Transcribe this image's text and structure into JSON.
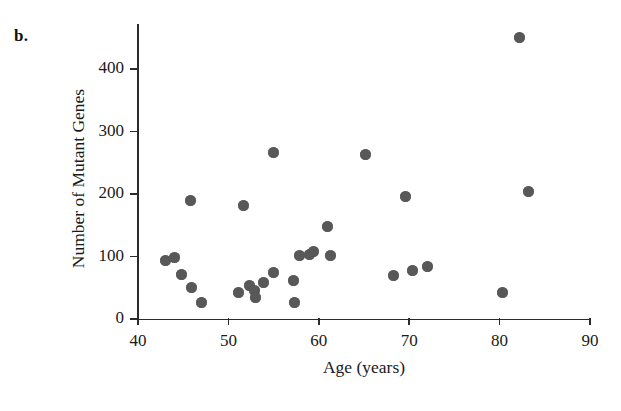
{
  "panel": {
    "label": "b."
  },
  "chart_data": {
    "type": "scatter",
    "title": "",
    "xlabel": "Age (years)",
    "ylabel": "Number of Mutant Genes",
    "xlim": [
      40,
      90
    ],
    "ylim": [
      0,
      450
    ],
    "xticks": [
      40,
      50,
      60,
      70,
      80,
      90
    ],
    "xtick_labels": [
      "40",
      "50",
      "60",
      "70",
      "80",
      "90"
    ],
    "yticks": [
      0,
      100,
      200,
      300,
      400
    ],
    "ytick_labels": [
      "0",
      "100",
      "200",
      "300",
      "400"
    ],
    "grid": false,
    "legend": null,
    "marker": {
      "shape": "circle",
      "color": "#585858",
      "size": 11
    },
    "series": [
      {
        "name": "Individuals",
        "points": [
          {
            "x": 43.0,
            "y": 93
          },
          {
            "x": 44.0,
            "y": 98
          },
          {
            "x": 44.8,
            "y": 72
          },
          {
            "x": 45.8,
            "y": 190
          },
          {
            "x": 45.9,
            "y": 50
          },
          {
            "x": 47.0,
            "y": 27
          },
          {
            "x": 51.1,
            "y": 42
          },
          {
            "x": 51.7,
            "y": 181
          },
          {
            "x": 52.3,
            "y": 54
          },
          {
            "x": 52.9,
            "y": 45
          },
          {
            "x": 53.0,
            "y": 34
          },
          {
            "x": 53.9,
            "y": 59
          },
          {
            "x": 55.0,
            "y": 75
          },
          {
            "x": 55.0,
            "y": 267
          },
          {
            "x": 57.2,
            "y": 61
          },
          {
            "x": 57.3,
            "y": 26
          },
          {
            "x": 57.9,
            "y": 102
          },
          {
            "x": 59.0,
            "y": 104
          },
          {
            "x": 59.4,
            "y": 108
          },
          {
            "x": 61.0,
            "y": 148
          },
          {
            "x": 61.3,
            "y": 101
          },
          {
            "x": 65.2,
            "y": 264
          },
          {
            "x": 68.3,
            "y": 70
          },
          {
            "x": 69.6,
            "y": 196
          },
          {
            "x": 70.4,
            "y": 77
          },
          {
            "x": 72.0,
            "y": 84
          },
          {
            "x": 80.3,
            "y": 43
          },
          {
            "x": 82.2,
            "y": 451
          },
          {
            "x": 83.2,
            "y": 204
          }
        ]
      }
    ]
  }
}
